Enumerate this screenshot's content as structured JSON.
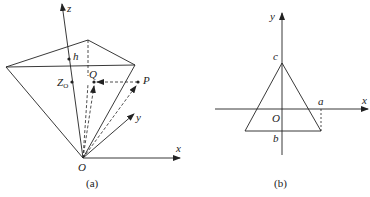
{
  "figure_a": {
    "caption": "(a)",
    "labels": {
      "z": "z",
      "x": "x",
      "y": "y",
      "origin": "O",
      "h": "h",
      "zo_main": "Z",
      "zo_sub": "O",
      "Q": "Q",
      "P": "P"
    }
  },
  "figure_b": {
    "caption": "(b)",
    "labels": {
      "y": "y",
      "x": "x",
      "origin": "O",
      "a": "a",
      "b": "b",
      "c": "c"
    }
  },
  "colors": {
    "line": "#222222",
    "background": "#ffffff"
  }
}
